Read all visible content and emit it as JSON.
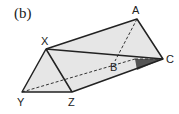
{
  "figure": {
    "label": "(b)",
    "vertices": {
      "A": "A",
      "B": "B",
      "C": "C",
      "X": "X",
      "Y": "Y",
      "Z": "Z"
    },
    "colors": {
      "face_fill": "#e6e6e6",
      "shaded_fill": "#555555",
      "stroke": "#222222"
    }
  }
}
